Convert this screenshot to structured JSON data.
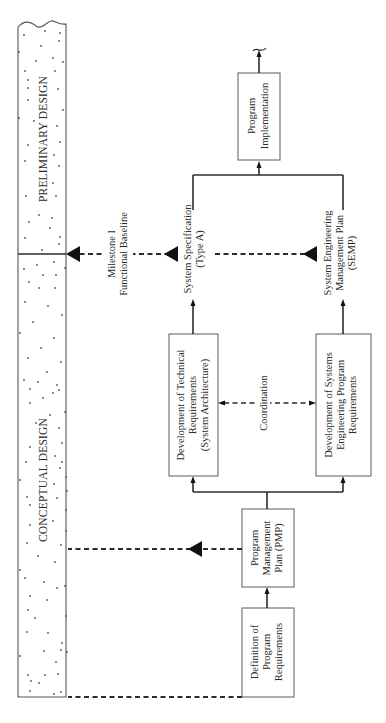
{
  "phases": {
    "preliminary": "PRELIMINARY DESIGN",
    "conceptual": "CONCEPTUAL DESIGN"
  },
  "boxes": {
    "definition": [
      "Definition of",
      "Program",
      "Requirements"
    ],
    "pmp": [
      "Program",
      "Management",
      "Plan (PMP)"
    ],
    "technical": [
      "Development of Technical",
      "Requirements",
      "(System Architecture)"
    ],
    "se_program": [
      "Development of Systems",
      "Engineering Program",
      "Requirements"
    ],
    "implementation": [
      "Program",
      "Implementation"
    ]
  },
  "outputs": {
    "system_spec": [
      "System Specification",
      "(Type A)"
    ],
    "semp": [
      "System Engineering",
      "Management Plan",
      "(SEMP)"
    ]
  },
  "milestone": [
    "Milestone I",
    "Functional Baseline"
  ],
  "coordination": "Coordination",
  "colors": {
    "line": "#2b2b2b",
    "box_stroke": "#6a6a6a",
    "text": "#2a2a2a"
  }
}
